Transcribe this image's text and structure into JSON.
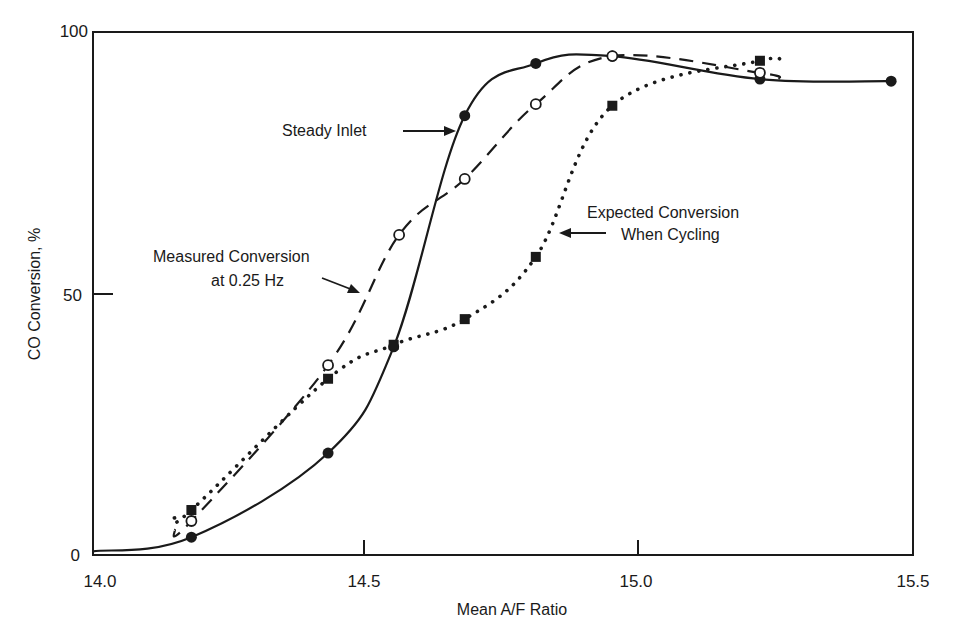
{
  "chart_data": {
    "type": "line",
    "title": "",
    "xlabel": "Mean A/F Ratio",
    "ylabel": "CO Conversion, %",
    "xlim": [
      14.0,
      15.5
    ],
    "ylim": [
      0,
      100
    ],
    "x_ticks": [
      14.0,
      14.5,
      15.0,
      15.5
    ],
    "x_tick_labels": [
      "14.0",
      "14.5",
      "15.0",
      "15.5"
    ],
    "y_ticks": [
      0,
      50,
      100
    ],
    "y_tick_labels": [
      "0",
      "50",
      "100"
    ],
    "grid": false,
    "legend": "none (inline annotations with arrows)",
    "series": [
      {
        "name": "Steady Inlet",
        "line_style": "solid",
        "marker": "filled-circle",
        "x": [
          14.18,
          14.43,
          14.55,
          14.68,
          14.81,
          14.95,
          15.22,
          15.46
        ],
        "y": [
          3.4,
          19.5,
          39.8,
          84.0,
          94.0,
          95.4,
          91.0,
          90.6
        ],
        "curve_start": [
          14.0,
          0.7
        ]
      },
      {
        "name": "Measured Conversion at 0.25 Hz",
        "line_style": "dashed",
        "marker": "open-circle",
        "x": [
          14.18,
          14.43,
          14.56,
          14.68,
          14.81,
          14.95,
          15.22
        ],
        "y": [
          6.5,
          36.3,
          61.2,
          71.9,
          86.2,
          95.4,
          92.2
        ]
      },
      {
        "name": "Expected Conversion When Cycling",
        "line_style": "dotted",
        "marker": "filled-square",
        "x": [
          14.18,
          14.43,
          14.55,
          14.68,
          14.81,
          14.95,
          15.22
        ],
        "y": [
          8.6,
          33.7,
          40.2,
          45.1,
          57.0,
          85.9,
          94.5
        ]
      }
    ],
    "annotations": [
      {
        "text": "Steady Inlet",
        "points_to": "Steady Inlet"
      },
      {
        "text": "Measured Conversion",
        "text2": "at 0.25 Hz",
        "points_to": "Measured Conversion at 0.25 Hz"
      },
      {
        "text": "Expected Conversion",
        "text2": "When Cycling",
        "points_to": "Expected Conversion When Cycling"
      }
    ]
  }
}
